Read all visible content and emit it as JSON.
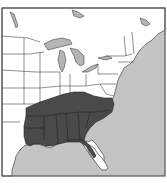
{
  "map": {
    "type": "species-range-map",
    "region": "Eastern United States",
    "range_description": "Shaded region covering the southeastern United States",
    "highlighted_states": [
      "Louisiana",
      "Mississippi",
      "Alabama",
      "Georgia",
      "South Carolina",
      "North Carolina",
      "Tennessee",
      "Arkansas",
      "Kentucky",
      "Florida (north)",
      "Virginia (south-east)"
    ],
    "colors": {
      "land": "#ffffff",
      "ocean": "#c4c4c4",
      "lakes": "#b5b5b5",
      "range": "#4a4a4a",
      "borders": "#444444",
      "frame": "#555555"
    }
  }
}
